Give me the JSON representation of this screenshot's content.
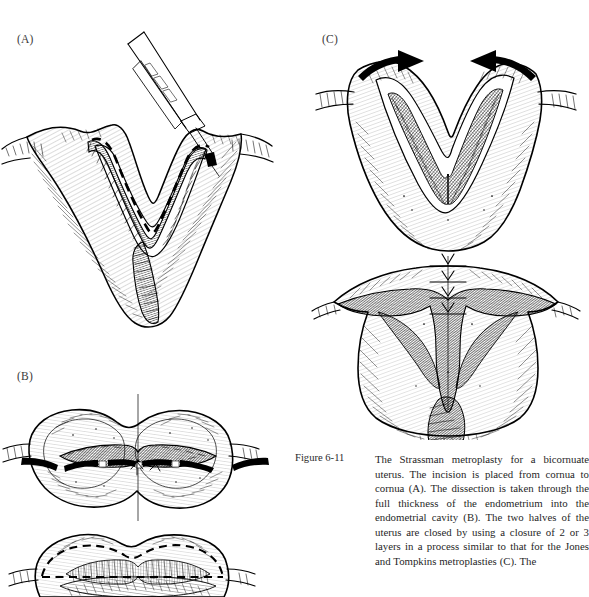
{
  "document": {
    "type": "textbook-figure-page",
    "ink_color": "#000000",
    "background_color": "#ffffff"
  },
  "panels": [
    {
      "id": "A",
      "label": "(A)",
      "description": "Bicornuate uterus with a deep V-shaped median cleft; a scalpel at the upper right marks the start of the incision; a bold dashed line traces the planned incision running from cornua to cornua across the fundus.",
      "elements": [
        "scalpel-instrument",
        "dashed-incision-line",
        "uterine-fundus-outline",
        "fallopian-tube-left",
        "fallopian-tube-right",
        "hatched-myometrium-shading"
      ]
    },
    {
      "id": "B",
      "label": "(B)",
      "description": "Two views of the bilobed uterus. Upper view: anterior aspect with a transverse full-thickness incision opened across the fundus exposing the dark endometrial cavity, with a vertical midline reference line. Lower view: opened specimen showing the dashed dissection plane carried through the full thickness of the endometrium into the endometrial cavity.",
      "elements": [
        "uterine-body-bilobed-outline",
        "transverse-incision-open",
        "endometrial-cavity-dark",
        "midline-reference-line",
        "dashed-dissection-plane",
        "hatched-myometrium-shading"
      ]
    },
    {
      "id": "C",
      "label": "(C)",
      "description": "Two views of the closure. Upper view: the open V-shaped uterus with two bold arrows at the fundus pointing toward one another to indicate approximation of the two halves. Lower view: the uterus after closure with a row of interrupted sutures along the new midline fundal incision, producing a single unified cavity.",
      "elements": [
        "approximation-arrow-left",
        "approximation-arrow-right",
        "open-v-cleft",
        "endometrial-lining-hatched",
        "sutured-closure-line",
        "interrupted-suture-marks",
        "unified-uterine-outline"
      ]
    }
  ],
  "caption": {
    "label": "Figure 6-11",
    "body": "The Strassman metroplasty for a bicornuate uterus. The incision is placed from cornua to cornua (A). The dissection is taken through the full thickness of the endometrium into the endometrial cavity (B). The two halves of the uterus are closed by using a closure of 2 or 3 layers in a process similar to that for the Jones and Tompkins metroplasties (C). The",
    "truncated": true
  }
}
